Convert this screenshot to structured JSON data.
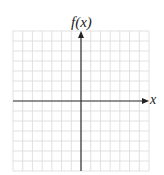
{
  "diagram": {
    "type": "coordinate-grid",
    "y_axis_label": "f(x)",
    "x_axis_label": "x",
    "grid": {
      "columns": 14,
      "rows": 14,
      "left": 13,
      "top": 31,
      "width": 136,
      "height": 140
    },
    "origin": {
      "x": 81,
      "y": 101
    },
    "colors": {
      "grid_line": "#d9d9d9",
      "axis": "#333333",
      "background": "#ffffff"
    }
  }
}
